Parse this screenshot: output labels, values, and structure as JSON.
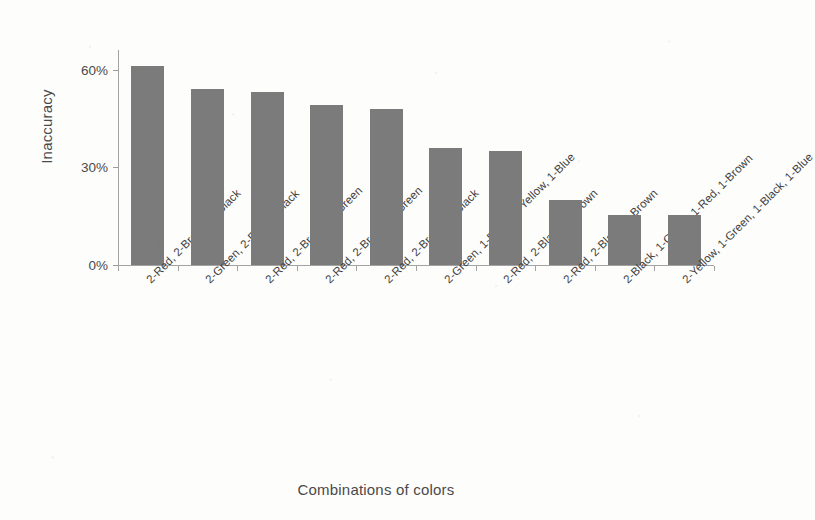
{
  "chart_data": {
    "type": "bar",
    "title": "",
    "xlabel": "Combinations of colors",
    "ylabel": "Inaccuracy",
    "categories": [
      "2-Red, 2-Brown, 1-Black",
      "2-Green, 2-Red, 1-Black",
      "2-Red, 2-Brown, 1-Green",
      "2-Red, 2-Brown, 1-Green",
      "2-Red, 2-Brown, 1-Black",
      "2-Green, 1-Black, 1-Yellow, 1-Blue",
      "2-Red, 2-Black, 1-Brown",
      "2-Red, 2-Black, 1-Brown",
      "2-Black, 1-Green, 1-Red, 1-Brown",
      "2-Yellow, 1-Green, 1-Black, 1-Blue"
    ],
    "values": [
      61,
      54,
      53,
      49,
      48,
      36,
      35,
      20,
      15.5,
      15.5
    ],
    "ytick_labels": [
      "0%",
      "30%",
      "60%"
    ],
    "ytick_values": [
      0,
      30,
      60
    ],
    "ylim": [
      0,
      66
    ],
    "grid": false,
    "legend": false,
    "bar_color": "#7b7b7b",
    "axis_color": "#a3a3a3",
    "text_color": "#4a4a4a"
  }
}
